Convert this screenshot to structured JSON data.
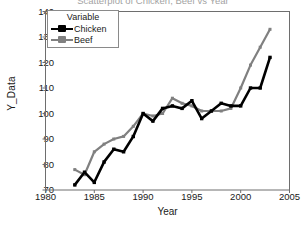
{
  "chart_data": {
    "type": "line",
    "title": "Scatterplot of Chicken, Beef vs Year",
    "xlabel": "Year",
    "ylabel": "Y_Data",
    "xlim": [
      1980,
      2005
    ],
    "ylim": [
      70,
      140
    ],
    "xticks": [
      1980,
      1985,
      1990,
      1995,
      2000,
      2005
    ],
    "yticks": [
      70,
      80,
      90,
      100,
      110,
      120,
      130,
      140
    ],
    "grid": false,
    "legend_title": "Variable",
    "legend_position": "top-left",
    "x": [
      1983,
      1984,
      1985,
      1986,
      1987,
      1988,
      1989,
      1990,
      1991,
      1992,
      1993,
      1994,
      1995,
      1996,
      1997,
      1998,
      1999,
      2000,
      2001,
      2002,
      2003
    ],
    "series": [
      {
        "name": "Chicken",
        "color": "#000000",
        "values": [
          72,
          77,
          73,
          81,
          86,
          85,
          91,
          100,
          97,
          102,
          103,
          102,
          105,
          98,
          101,
          104,
          103,
          103,
          110,
          110,
          122
        ]
      },
      {
        "name": "Beef",
        "color": "#808080",
        "values": [
          78,
          76,
          85,
          88,
          90,
          91,
          95,
          100,
          99,
          100,
          106,
          104,
          103,
          101,
          101,
          101,
          102,
          110,
          119,
          126,
          133
        ]
      }
    ]
  },
  "axis": {
    "y_title": "Y_Data",
    "x_title": "Year",
    "ytick_labels": [
      "140",
      "130",
      "120",
      "110",
      "100",
      "90",
      "80",
      "70"
    ],
    "xtick_labels": [
      "1980",
      "1985",
      "1990",
      "1995",
      "2000",
      "2005"
    ]
  },
  "legend": {
    "title": "Variable",
    "items": [
      {
        "label": "Chicken",
        "color": "#000000"
      },
      {
        "label": "Beef",
        "color": "#808080"
      }
    ]
  }
}
